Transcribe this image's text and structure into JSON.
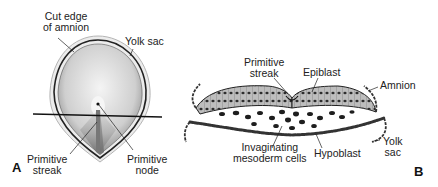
{
  "figure": {
    "panel_a": {
      "letter": "A",
      "labels": {
        "cut_edge_amnion_1": "Cut edge",
        "cut_edge_amnion_2": "of amnion",
        "yolk_sac": "Yolk sac",
        "primitive_streak_1": "Primitive",
        "primitive_streak_2": "streak",
        "primitive_node_1": "Primitive",
        "primitive_node_2": "node"
      }
    },
    "panel_b": {
      "letter": "B",
      "labels": {
        "primitive_streak_1": "Primitive",
        "primitive_streak_2": "streak",
        "epiblast": "Epiblast",
        "amnion": "Amnion",
        "invaginating_1": "Invaginating",
        "invaginating_2": "mesoderm cells",
        "hypoblast": "Hypoblast",
        "yolk_sac_1": "Yolk",
        "yolk_sac_2": "sac"
      }
    },
    "colors": {
      "ink": "#1a1a1a",
      "shade": "#9a9a9a",
      "light": "#d8d8d8"
    }
  }
}
